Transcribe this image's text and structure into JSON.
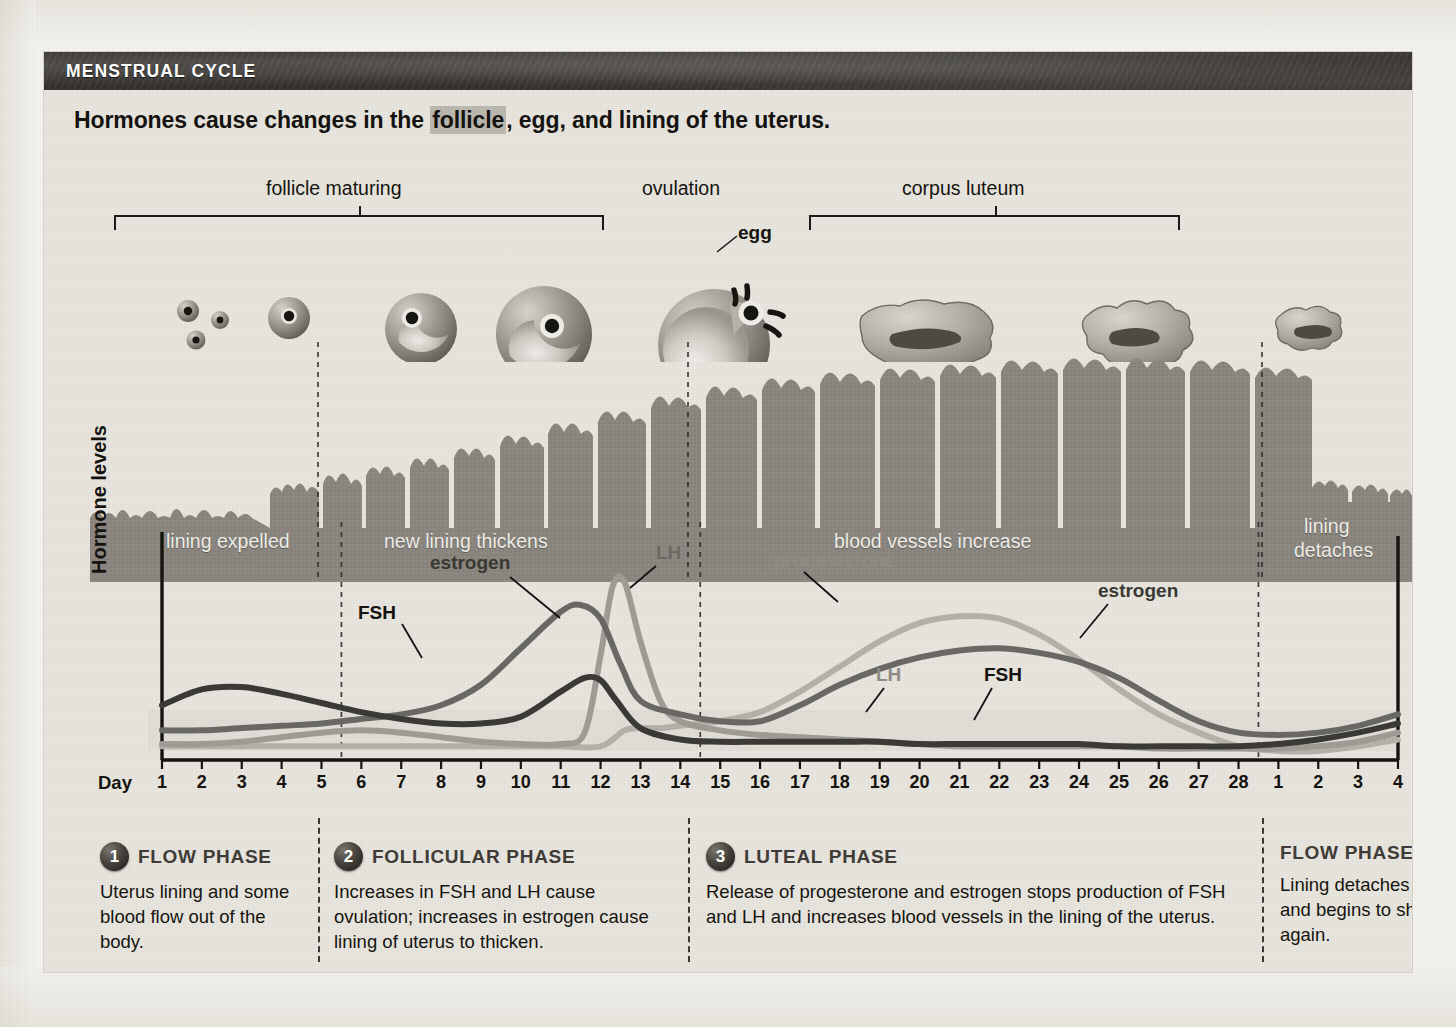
{
  "header": {
    "title": "MENSTRUAL CYCLE",
    "headline_pre": "Hormones cause changes in the ",
    "headline_highlight": "follicle",
    "headline_post": ", egg, and lining of the uterus."
  },
  "stage_labels": [
    {
      "text": "follicle maturing"
    },
    {
      "text": "ovulation"
    },
    {
      "text": "egg"
    },
    {
      "text": "corpus luteum"
    }
  ],
  "lining_labels": [
    {
      "text": "lining expelled"
    },
    {
      "text": "new lining thickens"
    },
    {
      "text": "blood vessels increase"
    },
    {
      "text": "lining"
    },
    {
      "text": "detaches"
    }
  ],
  "chart_axis": {
    "day_word": "Day",
    "y_label": "Hormone levels",
    "day_ticks": [
      "1",
      "2",
      "3",
      "4",
      "5",
      "6",
      "7",
      "8",
      "9",
      "10",
      "11",
      "12",
      "13",
      "14",
      "15",
      "16",
      "17",
      "18",
      "19",
      "20",
      "21",
      "22",
      "23",
      "24",
      "25",
      "26",
      "27",
      "28",
      "1",
      "2",
      "3",
      "4"
    ]
  },
  "curve_labels": [
    {
      "name": "FSH",
      "text": "FSH"
    },
    {
      "name": "estrogen",
      "text": "estrogen"
    },
    {
      "name": "LH",
      "text": "LH"
    },
    {
      "name": "progesterone",
      "text": "progesterone"
    },
    {
      "name": "LH2",
      "text": "LH"
    },
    {
      "name": "FSH2",
      "text": "FSH"
    },
    {
      "name": "estrogen2",
      "text": "estrogen"
    }
  ],
  "phases": [
    {
      "number": "1",
      "name": "FLOW PHASE",
      "body": "Uterus lining and some blood flow out of the body."
    },
    {
      "number": "2",
      "name": "FOLLICULAR PHASE",
      "body": "Increases in FSH and LH cause ovulation; increases in estrogen cause lining of uterus to thicken."
    },
    {
      "number": "3",
      "name": "LUTEAL PHASE",
      "body": "Release of progesterone and estrogen stops production of FSH and LH and increases blood vessels in the lining of the uterus."
    },
    {
      "number": "",
      "name": "FLOW PHASE",
      "body": "Lining detaches and begins to shed again."
    }
  ],
  "colors": {
    "panel_bg": "#e6e4dd",
    "title_bar": "#2e2b28",
    "lining_gray": "#8b8780",
    "fsh": "#3c3a36",
    "estrogen": "#6a6862",
    "lh": "#9e9c95",
    "progesterone": "#b3b1a9",
    "divider": "#3b3833"
  },
  "chart_data": {
    "type": "line",
    "xlabel": "Day",
    "ylabel": "Hormone levels",
    "xlim": [
      1,
      32
    ],
    "ylim": [
      0,
      100
    ],
    "grid": false,
    "legend": "inline-annotations",
    "x_tick_labels": [
      "1",
      "2",
      "3",
      "4",
      "5",
      "6",
      "7",
      "8",
      "9",
      "10",
      "11",
      "12",
      "13",
      "14",
      "15",
      "16",
      "17",
      "18",
      "19",
      "20",
      "21",
      "22",
      "23",
      "24",
      "25",
      "26",
      "27",
      "28",
      "1",
      "2",
      "3",
      "4"
    ],
    "x_tick_values": [
      1,
      2,
      3,
      4,
      5,
      6,
      7,
      8,
      9,
      10,
      11,
      12,
      13,
      14,
      15,
      16,
      17,
      18,
      19,
      20,
      21,
      22,
      23,
      24,
      25,
      26,
      27,
      28,
      29,
      30,
      31,
      32
    ],
    "phase_boundaries_day": [
      5.5,
      14.5,
      28.5
    ],
    "series": [
      {
        "name": "FSH",
        "color": "#3c3a36",
        "x": [
          1,
          2,
          3,
          4,
          5,
          6,
          7,
          8,
          9,
          10,
          11,
          11.6,
          12,
          12.4,
          13,
          14,
          15,
          16,
          17,
          18,
          19,
          20,
          21,
          22,
          23,
          24,
          25,
          26,
          27,
          28,
          29,
          30,
          31,
          32
        ],
        "y": [
          24,
          31,
          32,
          29,
          25,
          21,
          18,
          16,
          16,
          19,
          30,
          36,
          35,
          26,
          14,
          9,
          8,
          8,
          8,
          8,
          8,
          7,
          7,
          7,
          7,
          7,
          6,
          6,
          6,
          6,
          7,
          9,
          12,
          16
        ]
      },
      {
        "name": "estrogen",
        "color": "#6a6862",
        "x": [
          1,
          2,
          3,
          4,
          5,
          6,
          7,
          8,
          9,
          10,
          11,
          11.5,
          12,
          12.5,
          13,
          14,
          15,
          16,
          17,
          18,
          19,
          20,
          21,
          22,
          23,
          24,
          25,
          26,
          27,
          28,
          29,
          30,
          31,
          32
        ],
        "y": [
          13,
          13,
          14,
          15,
          16,
          18,
          20,
          24,
          33,
          49,
          65,
          68,
          62,
          42,
          26,
          20,
          17,
          17,
          24,
          33,
          40,
          45,
          48,
          49,
          47,
          43,
          36,
          26,
          17,
          12,
          11,
          12,
          15,
          20
        ]
      },
      {
        "name": "LH",
        "color": "#9e9c95",
        "x": [
          1,
          2,
          3,
          4,
          5,
          6,
          7,
          8,
          9,
          10,
          11,
          11.6,
          12,
          12.3,
          12.6,
          13,
          13.5,
          14,
          15,
          16,
          17,
          18,
          19,
          20,
          21,
          22,
          23,
          24,
          25,
          26,
          27,
          28,
          29,
          30,
          31,
          32
        ],
        "y": [
          7,
          7,
          8,
          10,
          12,
          13,
          12,
          10,
          8,
          7,
          7,
          12,
          46,
          76,
          78,
          52,
          26,
          17,
          13,
          11,
          10,
          9,
          8,
          7,
          6,
          6,
          6,
          6,
          6,
          5,
          5,
          5,
          5,
          6,
          8,
          12
        ]
      },
      {
        "name": "progesterone",
        "color": "#b3b1a9",
        "x": [
          1,
          2,
          3,
          4,
          5,
          6,
          7,
          8,
          9,
          10,
          11,
          12,
          12.6,
          13,
          13.5,
          14,
          15,
          16,
          17,
          18,
          19,
          20,
          21,
          22,
          23,
          24,
          25,
          26,
          27,
          28,
          29,
          30,
          31,
          32
        ],
        "y": [
          6,
          6,
          6,
          6,
          6,
          6,
          6,
          6,
          6,
          6,
          6,
          6,
          13,
          14,
          14,
          15,
          17,
          21,
          30,
          41,
          52,
          60,
          63,
          62,
          55,
          44,
          31,
          20,
          12,
          6,
          4,
          4,
          6,
          9
        ]
      }
    ],
    "annotations": [
      {
        "text": "FSH",
        "day": 6.3
      },
      {
        "text": "estrogen",
        "day": 10.0
      },
      {
        "text": "LH",
        "day": 14.2
      },
      {
        "text": "progesterone",
        "day": 17.4
      },
      {
        "text": "LH",
        "day": 20.0
      },
      {
        "text": "FSH",
        "day": 23.0
      },
      {
        "text": "estrogen",
        "day": 26.0
      }
    ]
  }
}
